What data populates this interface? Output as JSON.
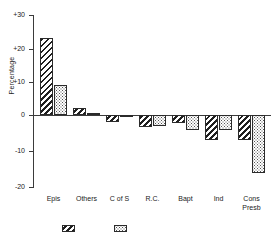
{
  "chart_data": {
    "type": "bar",
    "title": "",
    "subtitle": "",
    "xlabel": "",
    "ylabel": "Percentage",
    "ylim": [
      -20,
      30
    ],
    "yticks": [
      30,
      20,
      10,
      0,
      -10,
      -20
    ],
    "ytick_labels": [
      "+30",
      "+20",
      "+10",
      "0",
      "-10",
      "-20"
    ],
    "grid": false,
    "legend_position": "bottom",
    "categories": [
      "Epis",
      "Others",
      "C of S",
      "R.C.",
      "Bapt",
      "Ind",
      "Cons\nPresb"
    ],
    "series": [
      {
        "name": "",
        "pattern": "diagonal-hatch",
        "values": [
          23.0,
          2.0,
          -2.0,
          -3.5,
          -2.5,
          -7.5,
          -7.5
        ]
      },
      {
        "name": "",
        "pattern": "dotted",
        "values": [
          9.0,
          0.5,
          -0.7,
          -3.2,
          -4.5,
          -4.5,
          -17.5
        ]
      }
    ],
    "legend_items": [
      {
        "label": "",
        "pattern": "diagonal-hatch"
      },
      {
        "label": "",
        "pattern": "dotted"
      }
    ]
  }
}
